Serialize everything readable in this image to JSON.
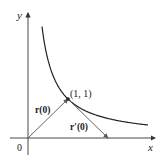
{
  "axes": {
    "x_label": "x",
    "y_label": "y",
    "origin_label": "0"
  },
  "curve": {
    "equation": "y = 1/x",
    "x_range": [
      0.35,
      3.0
    ]
  },
  "point": {
    "label": "(1, 1)",
    "x": 1,
    "y": 1
  },
  "vectors": {
    "position": {
      "label": "r(0)",
      "from": [
        0,
        0
      ],
      "to": [
        1,
        1
      ]
    },
    "tangent": {
      "label": "r′(0)",
      "from": [
        1,
        1
      ],
      "to": [
        2,
        0
      ]
    }
  },
  "colors": {
    "axis": "#333333",
    "curve": "#222222",
    "vector": "#555555"
  }
}
